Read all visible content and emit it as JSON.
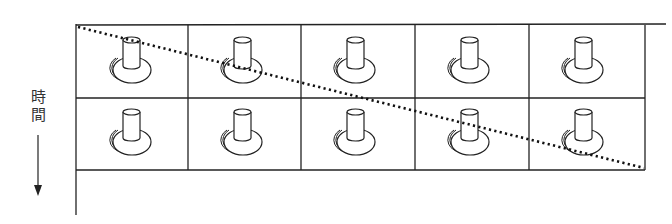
{
  "axis": {
    "label": "時間",
    "direction": "down",
    "arrow_icon": "arrow-down-icon"
  },
  "grid": {
    "rows": 2,
    "columns": 5,
    "cell_icon": "flask-bottle-icon"
  },
  "diagonal": {
    "style": "dotted",
    "from": "top-left",
    "to": "bottom-right"
  },
  "colors": {
    "line": "#222222",
    "background": "#ffffff"
  }
}
